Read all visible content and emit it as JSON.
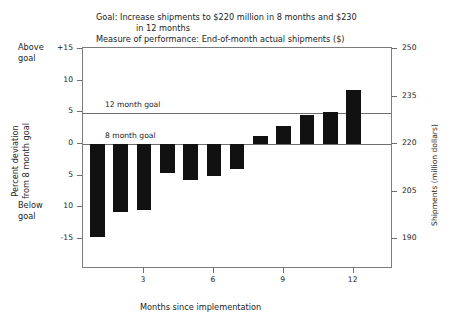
{
  "title": {
    "line1": "Goal: Increase shipments to $220 million in 8 months and $230",
    "line2": "in 12 months",
    "line3": "Measure of performance: End-of-month actual shipments ($)",
    "line4": "compared to goal"
  },
  "annotations": {
    "above_goal": "Above\ngoal",
    "below_goal": "Below\ngoal",
    "goal_12_month": "12 month goal",
    "goal_8_month": "8 month goal"
  },
  "axes": {
    "left_title": "Percent deviation\nfrom 8 month goal",
    "right_title": "Shipments (million dollars)",
    "x_title": "Months since implementation",
    "left_ticks": [
      "+15",
      "10",
      "5",
      "0",
      "5",
      "10",
      "-15"
    ],
    "right_ticks": [
      "250",
      "235",
      "220",
      "205",
      "190"
    ],
    "x_ticks": [
      "3",
      "6",
      "9",
      "12"
    ]
  },
  "chart_data": {
    "type": "bar",
    "title": "Goal: Increase shipments to $220 million in 8 months and $230 in 12 months",
    "subtitle": "Measure of performance: End-of-month actual shipments ($) compared to goal",
    "xlabel": "Months since implementation",
    "ylabel": "Percent deviation from 8 month goal",
    "y2label": "Shipments (million dollars)",
    "categories": [
      1,
      2,
      3,
      4,
      5,
      6,
      7,
      8,
      9,
      10,
      11,
      12
    ],
    "values": [
      -14.7,
      -10.7,
      -10.4,
      -4.6,
      -5.7,
      -5.1,
      -4.0,
      1.2,
      2.9,
      4.6,
      5.1,
      8.5
    ],
    "ylim": [
      -15,
      15
    ],
    "y2lim": [
      190,
      250
    ],
    "y_ticks": [
      15,
      10,
      5,
      0,
      -5,
      -10,
      -15
    ],
    "y_tick_labels": [
      "+15",
      "10",
      "5",
      "0",
      "5",
      "10",
      "-15"
    ],
    "y2_ticks": [
      250,
      235,
      220,
      205,
      190
    ],
    "x_ticks": [
      3,
      6,
      9,
      12
    ],
    "grid": false,
    "legend": "none",
    "bar_color": "#111111",
    "reference_lines": [
      {
        "label": "8 month goal",
        "value": 0
      },
      {
        "label": "12 month goal",
        "value": 4.9
      }
    ]
  }
}
